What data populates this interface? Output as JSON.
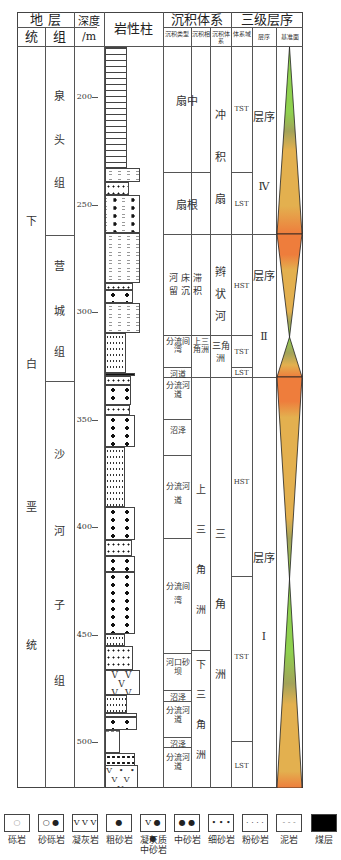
{
  "header": {
    "stratigraphy": "地 层",
    "series": "统",
    "formation": "组",
    "depth": "深度",
    "depth_unit": "/m",
    "lithology": "岩性柱",
    "sedimentary_system": "沉积体系",
    "sed_type": "沉积类型",
    "sed_facies": "沉积相",
    "sed_system": "沉积体系",
    "sequence_3rd": "三级层序",
    "systems_tract": "体系域",
    "sequence": "层序",
    "base_level": "基准面"
  },
  "series": {
    "label": "下白垩统",
    "chars": [
      "下",
      "白",
      "垩",
      "统"
    ]
  },
  "formations": [
    {
      "name": "泉头组",
      "chars": [
        "泉",
        "头",
        "组"
      ]
    },
    {
      "name": "营城组",
      "chars": [
        "营",
        "城",
        "组"
      ]
    },
    {
      "name": "沙河子组",
      "chars": [
        "沙",
        "河",
        "子",
        "组"
      ]
    }
  ],
  "depth_ticks": [
    "200",
    "250",
    "300",
    "350",
    "400",
    "450",
    "500"
  ],
  "sed_types": [
    {
      "label": "扇中"
    },
    {
      "label": "扇根"
    },
    {
      "label": "河床滞留沉积"
    },
    {
      "label": "分流间湾"
    },
    {
      "label": "河道"
    },
    {
      "label": "分流河道"
    },
    {
      "label": "沼泽"
    },
    {
      "label": "分流河道"
    },
    {
      "label": "分流间湾"
    },
    {
      "label": "河口砂坝"
    },
    {
      "label": "沼泽"
    },
    {
      "label": "分流河道"
    },
    {
      "label": "沼泽"
    },
    {
      "label": "分流河道"
    }
  ],
  "sed_facies": [
    {
      "label": "上三角洲"
    },
    {
      "label": "上三角洲"
    },
    {
      "label": "下三角洲"
    }
  ],
  "sed_systems": [
    {
      "label": "冲积扇"
    },
    {
      "label": "辫状河"
    },
    {
      "label": "三角洲"
    },
    {
      "label": "三角洲"
    }
  ],
  "systems_tracts": [
    "TST",
    "LST",
    "HST",
    "TST",
    "LST",
    "HST",
    "TST",
    "LST"
  ],
  "sequences": [
    {
      "label": "层序",
      "numeral": "Ⅳ"
    },
    {
      "label": "层序",
      "numeral": "Ⅱ"
    },
    {
      "label": "层序",
      "numeral": "Ⅰ"
    }
  ],
  "base_level_colors": {
    "green": "#8fd14f",
    "olive": "#a3a35a",
    "tan": "#e3b04f",
    "orange": "#ee7d3c"
  },
  "legend": [
    {
      "label": "砾岩",
      "symbol": "○"
    },
    {
      "label": "砂砾岩",
      "symbol": "○ ●"
    },
    {
      "label": "凝灰岩",
      "symbol": "V V V"
    },
    {
      "label": "粗砂岩",
      "symbol": "●"
    },
    {
      "label": "凝灰质中砂岩",
      "symbol": "V ● ●"
    },
    {
      "label": "中砂岩",
      "symbol": "● ●"
    },
    {
      "label": "细砂岩",
      "symbol": "• • •"
    },
    {
      "label": "粉砂岩",
      "symbol": "· · · ·"
    },
    {
      "label": "泥岩",
      "symbol": "- - -"
    },
    {
      "label": "煤层",
      "symbol": ""
    }
  ]
}
